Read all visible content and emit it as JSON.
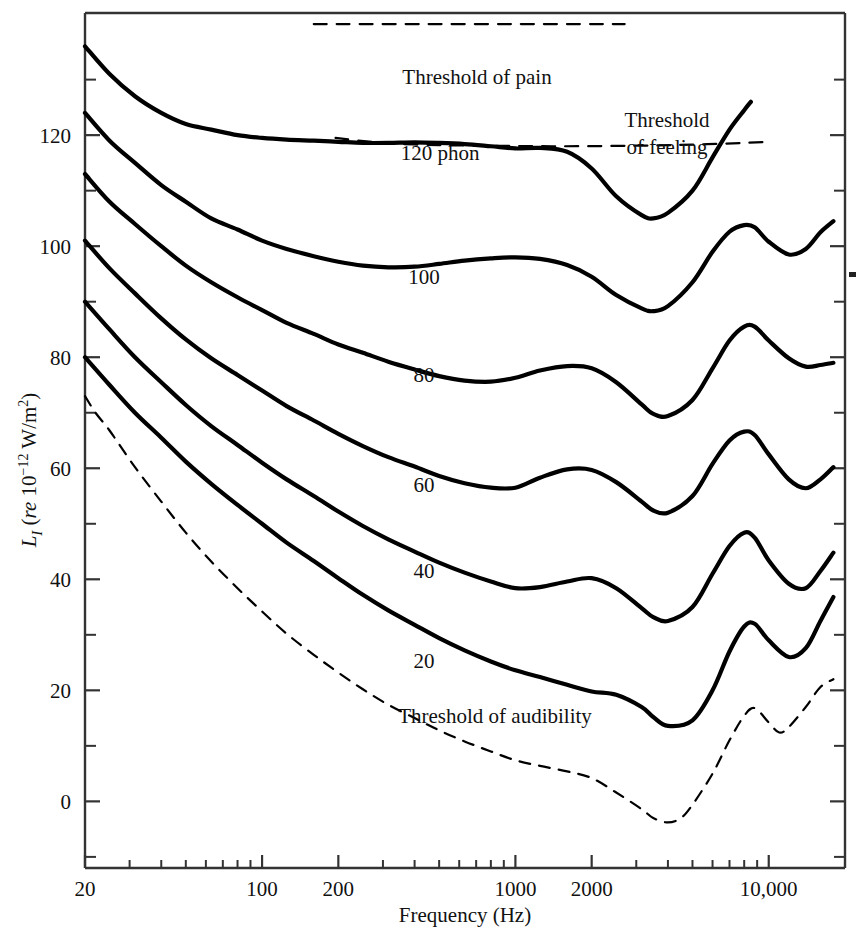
{
  "chart_data": {
    "type": "line",
    "title": "",
    "xlabel": "Frequency (Hz)",
    "ylabel": "L_I (re 10^-12 W/m^2)",
    "ylabel_parts": {
      "symbol": "L",
      "subscript": "I",
      "rest_open": "(",
      "re": "re",
      "base": "10",
      "exponent": "−12",
      "units": "W/m",
      "units_exp": "2",
      "rest_close": ")"
    },
    "xscale": "log",
    "xlim": [
      20,
      20000
    ],
    "ylim": [
      -12,
      142
    ],
    "xticks_major": [
      20,
      100,
      200,
      1000,
      2000,
      10000
    ],
    "xticklabels": [
      "20",
      "100",
      "200",
      "1000",
      "2000",
      "10,000"
    ],
    "xticks_minor": [
      30,
      40,
      50,
      60,
      70,
      80,
      90,
      300,
      400,
      500,
      600,
      700,
      800,
      900,
      3000,
      4000,
      5000,
      6000,
      7000,
      8000,
      9000,
      20000
    ],
    "yticks_major": [
      0,
      20,
      40,
      60,
      80,
      100,
      120
    ],
    "yticklabels": [
      "0",
      "20",
      "40",
      "60",
      "80",
      "100",
      "120"
    ],
    "yticks_minor": [
      -10,
      10,
      30,
      50,
      70,
      90,
      110,
      130
    ],
    "grid": false,
    "legend": "inline-labels",
    "series": [
      {
        "name": "120 phon",
        "label": "120 phon",
        "style": "solid",
        "label_x": 440,
        "label_y": 160,
        "points": [
          [
            20,
            136
          ],
          [
            25,
            131
          ],
          [
            31.5,
            127
          ],
          [
            40,
            124
          ],
          [
            50,
            122
          ],
          [
            63,
            121
          ],
          [
            80,
            120
          ],
          [
            100,
            119.5
          ],
          [
            125,
            119.2
          ],
          [
            160,
            119
          ],
          [
            200,
            118.8
          ],
          [
            250,
            118.6
          ],
          [
            315,
            118.6
          ],
          [
            400,
            118.7
          ],
          [
            500,
            118.6
          ],
          [
            630,
            118.4
          ],
          [
            800,
            118.0
          ],
          [
            1000,
            117.6
          ],
          [
            1250,
            117.7
          ],
          [
            1600,
            117.0
          ],
          [
            2000,
            114.0
          ],
          [
            2500,
            109.0
          ],
          [
            3150,
            105.6
          ],
          [
            3500,
            105.0
          ],
          [
            4000,
            106.0
          ],
          [
            5000,
            110.0
          ],
          [
            6000,
            116.0
          ],
          [
            7000,
            121.0
          ],
          [
            8000,
            124.5
          ],
          [
            8500,
            126.0
          ]
        ]
      },
      {
        "name": "100 phon",
        "label": "100",
        "style": "solid",
        "label_x": 424,
        "label_y": 284,
        "points": [
          [
            20,
            124
          ],
          [
            25,
            119
          ],
          [
            31.5,
            115
          ],
          [
            40,
            111
          ],
          [
            50,
            108
          ],
          [
            63,
            105
          ],
          [
            80,
            103
          ],
          [
            100,
            101
          ],
          [
            125,
            99.5
          ],
          [
            160,
            98.2
          ],
          [
            200,
            97.2
          ],
          [
            250,
            96.5
          ],
          [
            315,
            96.2
          ],
          [
            400,
            96.3
          ],
          [
            500,
            96.8
          ],
          [
            630,
            97.4
          ],
          [
            800,
            97.8
          ],
          [
            1000,
            98.0
          ],
          [
            1250,
            97.7
          ],
          [
            1600,
            96.6
          ],
          [
            2000,
            94.5
          ],
          [
            2500,
            91.2
          ],
          [
            3150,
            88.8
          ],
          [
            3500,
            88.3
          ],
          [
            4000,
            89.2
          ],
          [
            5000,
            93.5
          ],
          [
            6000,
            99.0
          ],
          [
            7000,
            102.6
          ],
          [
            8000,
            103.8
          ],
          [
            8800,
            103.4
          ],
          [
            10000,
            100.8
          ],
          [
            12000,
            98.5
          ],
          [
            14000,
            99.5
          ],
          [
            16000,
            102.5
          ],
          [
            18000,
            104.5
          ]
        ]
      },
      {
        "name": "80 phon",
        "label": "80",
        "style": "solid",
        "label_x": 424,
        "label_y": 382,
        "points": [
          [
            20,
            113
          ],
          [
            25,
            108
          ],
          [
            31.5,
            104
          ],
          [
            40,
            100
          ],
          [
            50,
            96.5
          ],
          [
            63,
            93.5
          ],
          [
            80,
            90.8
          ],
          [
            100,
            88.5
          ],
          [
            125,
            86.2
          ],
          [
            160,
            84.2
          ],
          [
            200,
            82.3
          ],
          [
            250,
            80.8
          ],
          [
            315,
            79.2
          ],
          [
            400,
            77.8
          ],
          [
            500,
            76.6
          ],
          [
            630,
            75.8
          ],
          [
            800,
            75.6
          ],
          [
            1000,
            76.3
          ],
          [
            1250,
            77.6
          ],
          [
            1600,
            78.4
          ],
          [
            2000,
            78.0
          ],
          [
            2500,
            75.5
          ],
          [
            3150,
            71.5
          ],
          [
            3500,
            69.8
          ],
          [
            4000,
            69.4
          ],
          [
            5000,
            72.3
          ],
          [
            6000,
            78.0
          ],
          [
            7000,
            83.0
          ],
          [
            8000,
            85.5
          ],
          [
            8800,
            85.5
          ],
          [
            10000,
            83.0
          ],
          [
            12000,
            79.8
          ],
          [
            14000,
            78.3
          ],
          [
            16000,
            78.6
          ],
          [
            18000,
            79.0
          ]
        ]
      },
      {
        "name": "60 phon",
        "label": "60",
        "style": "solid",
        "label_x": 424,
        "label_y": 492,
        "points": [
          [
            20,
            101
          ],
          [
            25,
            96
          ],
          [
            31.5,
            91.5
          ],
          [
            40,
            87
          ],
          [
            50,
            83.2
          ],
          [
            63,
            79.8
          ],
          [
            80,
            76.8
          ],
          [
            100,
            74
          ],
          [
            125,
            71.2
          ],
          [
            160,
            68.6
          ],
          [
            200,
            66.2
          ],
          [
            250,
            64
          ],
          [
            315,
            62
          ],
          [
            400,
            60.3
          ],
          [
            500,
            58.6
          ],
          [
            630,
            57.3
          ],
          [
            800,
            56.5
          ],
          [
            1000,
            56.5
          ],
          [
            1250,
            58.3
          ],
          [
            1600,
            59.8
          ],
          [
            2000,
            59.7
          ],
          [
            2500,
            57.5
          ],
          [
            3150,
            54.0
          ],
          [
            3500,
            52.4
          ],
          [
            4000,
            52.0
          ],
          [
            5000,
            55.0
          ],
          [
            6000,
            60.8
          ],
          [
            7000,
            65.0
          ],
          [
            8000,
            66.6
          ],
          [
            8800,
            66.0
          ],
          [
            10000,
            62.5
          ],
          [
            12000,
            58.0
          ],
          [
            14000,
            56.4
          ],
          [
            16000,
            58.0
          ],
          [
            18000,
            60.2
          ]
        ]
      },
      {
        "name": "40 phon",
        "label": "40",
        "style": "solid",
        "label_x": 424,
        "label_y": 578,
        "points": [
          [
            20,
            90
          ],
          [
            25,
            85
          ],
          [
            31.5,
            80
          ],
          [
            40,
            75.5
          ],
          [
            50,
            71.4
          ],
          [
            63,
            67.6
          ],
          [
            80,
            64.2
          ],
          [
            100,
            61
          ],
          [
            125,
            58
          ],
          [
            160,
            55
          ],
          [
            200,
            52.2
          ],
          [
            250,
            49.6
          ],
          [
            315,
            47.2
          ],
          [
            400,
            45
          ],
          [
            500,
            43
          ],
          [
            630,
            41.2
          ],
          [
            800,
            39.6
          ],
          [
            1000,
            38.4
          ],
          [
            1250,
            38.6
          ],
          [
            1600,
            39.6
          ],
          [
            2000,
            40.2
          ],
          [
            2500,
            38.4
          ],
          [
            3150,
            34.8
          ],
          [
            3500,
            33.2
          ],
          [
            4000,
            32.5
          ],
          [
            5000,
            35.0
          ],
          [
            6000,
            41.0
          ],
          [
            7000,
            46.0
          ],
          [
            8000,
            48.4
          ],
          [
            8800,
            47.5
          ],
          [
            10000,
            43.4
          ],
          [
            12000,
            39.2
          ],
          [
            14000,
            38.4
          ],
          [
            16000,
            41.5
          ],
          [
            18000,
            44.8
          ]
        ]
      },
      {
        "name": "20 phon",
        "label": "20",
        "style": "solid",
        "label_x": 424,
        "label_y": 668,
        "points": [
          [
            20,
            80
          ],
          [
            25,
            75
          ],
          [
            31.5,
            70
          ],
          [
            40,
            65.5
          ],
          [
            50,
            61.2
          ],
          [
            63,
            57.2
          ],
          [
            80,
            53.4
          ],
          [
            100,
            50
          ],
          [
            125,
            46.6
          ],
          [
            160,
            43.3
          ],
          [
            200,
            40.2
          ],
          [
            250,
            37.2
          ],
          [
            315,
            34.4
          ],
          [
            400,
            31.8
          ],
          [
            500,
            29.4
          ],
          [
            630,
            27.2
          ],
          [
            800,
            25.2
          ],
          [
            1000,
            23.6
          ],
          [
            1250,
            22.4
          ],
          [
            1600,
            21.0
          ],
          [
            2000,
            19.8
          ],
          [
            2500,
            19.2
          ],
          [
            3150,
            17.0
          ],
          [
            3500,
            15.2
          ],
          [
            4000,
            13.6
          ],
          [
            5000,
            14.6
          ],
          [
            6000,
            20.0
          ],
          [
            7000,
            27.0
          ],
          [
            8000,
            31.5
          ],
          [
            8800,
            32.0
          ],
          [
            10000,
            29.0
          ],
          [
            12000,
            26.0
          ],
          [
            14000,
            27.6
          ],
          [
            16000,
            32.5
          ],
          [
            18000,
            36.8
          ]
        ]
      },
      {
        "name": "Threshold of audibility",
        "label": "Threshold of audibility",
        "style": "dashed",
        "label_x": 495,
        "label_y": 723,
        "points": [
          [
            20,
            73
          ],
          [
            22,
            70
          ],
          [
            25,
            66.8
          ],
          [
            31.5,
            60.2
          ],
          [
            40,
            54.0
          ],
          [
            50,
            48.4
          ],
          [
            63,
            43.2
          ],
          [
            80,
            38.4
          ],
          [
            100,
            34.2
          ],
          [
            125,
            30.2
          ],
          [
            160,
            26.4
          ],
          [
            200,
            23.2
          ],
          [
            250,
            20.2
          ],
          [
            315,
            17.4
          ],
          [
            400,
            15.0
          ],
          [
            500,
            12.8
          ],
          [
            630,
            10.8
          ],
          [
            800,
            9.0
          ],
          [
            1000,
            7.4
          ],
          [
            1250,
            6.4
          ],
          [
            1600,
            5.4
          ],
          [
            2000,
            4.2
          ],
          [
            2500,
            1.6
          ],
          [
            3150,
            -1.4
          ],
          [
            3500,
            -3.0
          ],
          [
            4000,
            -3.8
          ],
          [
            4500,
            -3.0
          ],
          [
            5000,
            -0.6
          ],
          [
            6000,
            5.0
          ],
          [
            7000,
            11.0
          ],
          [
            8000,
            15.4
          ],
          [
            8800,
            16.8
          ],
          [
            10000,
            14.2
          ],
          [
            11000,
            12.4
          ],
          [
            12000,
            13.4
          ],
          [
            14000,
            17.0
          ],
          [
            16000,
            20.6
          ],
          [
            18000,
            22.0
          ]
        ]
      },
      {
        "name": "Threshold of pain",
        "label": "Threshold of pain",
        "style": "dashed-flat",
        "label_x": 477,
        "label_y": 84,
        "points": [
          [
            160,
            140
          ],
          [
            2700,
            140
          ]
        ]
      },
      {
        "name": "Threshold of feeling",
        "label": "Threshold of feeling",
        "label_line1": "Threshold",
        "label_line2": "of feeling",
        "style": "dashed-flat",
        "label_x": 667,
        "label_y": 127,
        "label2_y": 154,
        "points": [
          [
            195,
            119.5
          ],
          [
            300,
            118.6
          ],
          [
            500,
            118.2
          ],
          [
            800,
            118.1
          ],
          [
            1500,
            118.0
          ],
          [
            3000,
            118.1
          ],
          [
            5000,
            118.3
          ],
          [
            8000,
            118.6
          ],
          [
            10000,
            118.8
          ]
        ]
      }
    ],
    "annotations": [
      {
        "name": "threshold-of-pain-label",
        "text": "Threshold of pain"
      },
      {
        "name": "threshold-of-feeling-label",
        "text": "Threshold of feeling"
      },
      {
        "name": "threshold-of-audibility-label",
        "text": "Threshold of audibility"
      }
    ],
    "colors": {
      "curve": "#000000",
      "axis": "#222222",
      "background": "#ffffff"
    }
  },
  "labels": {
    "xaxis_title": "Frequency (Hz)",
    "phon_120": "120 phon",
    "phon_100": "100",
    "phon_80": "80",
    "phon_60": "60",
    "phon_40": "40",
    "phon_20": "20",
    "pain": "Threshold of pain",
    "feeling_l1": "Threshold",
    "feeling_l2": "of feeling",
    "audibility": "Threshold of audibility",
    "y_sym": "L",
    "y_sub": "I",
    "y_open": "(",
    "y_re": "re",
    "y_base": " 10",
    "y_exp": "−12",
    "y_units": " W/m",
    "y_units_exp": "2",
    "y_close": ")"
  }
}
